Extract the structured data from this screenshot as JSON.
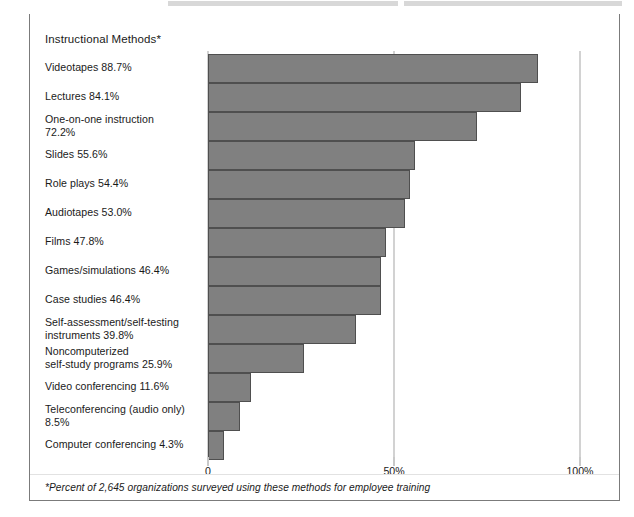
{
  "figure": {
    "title": "Instructional Methods*",
    "footnote": "*Percent of 2,645 organizations surveyed using these methods for employee training",
    "bar_color": "#808080",
    "bar_border_color": "#4f4f4f",
    "gridline_color": "#d2d2d2",
    "frame_color": "#7b7b7b"
  },
  "chart_data": {
    "type": "bar",
    "orientation": "horizontal",
    "title": "Instructional Methods*",
    "xlabel": "",
    "ylabel": "",
    "xlim": [
      0,
      100
    ],
    "grid": true,
    "legend": null,
    "xticks": [
      0,
      50,
      100
    ],
    "xtick_labels": [
      "0",
      "50%",
      "100%"
    ],
    "annotations": [
      "*Percent of 2,645 organizations surveyed using these methods for employee training"
    ],
    "categories": [
      "Videotapes",
      "Lectures",
      "One-on-one instruction",
      "Slides",
      "Role plays",
      "Audiotapes",
      "Films",
      "Games/simulations",
      "Case studies",
      "Self-assessment/self-testing instruments",
      "Noncomputerized self-study programs",
      "Video conferencing",
      "Teleconferencing (audio only)",
      "Computer conferencing"
    ],
    "values": [
      88.7,
      84.1,
      72.2,
      55.6,
      54.4,
      53.0,
      47.8,
      46.4,
      46.4,
      39.8,
      25.9,
      11.6,
      8.5,
      4.3
    ],
    "labels": [
      "Videotapes 88.7%",
      "Lectures 84.1%",
      "One-on-one instruction 72.2%",
      "Slides 55.6%",
      "Role plays 54.4%",
      "Audiotapes 53.0%",
      "Films 47.8%",
      "Games/simulations 46.4%",
      "Case studies 46.4%",
      "Self-assessment/self-testing instruments 39.8%",
      "Noncomputerized self-study programs 25.9%",
      "Video conferencing 11.6%",
      "Teleconferencing (audio only) 8.5%",
      "Computer conferencing 4.3%"
    ],
    "label_lines": [
      [
        "Videotapes 88.7%"
      ],
      [
        "Lectures 84.1%"
      ],
      [
        "One-on-one instruction",
        "72.2%"
      ],
      [
        "Slides 55.6%"
      ],
      [
        "Role plays 54.4%"
      ],
      [
        "Audiotapes 53.0%"
      ],
      [
        "Films 47.8%"
      ],
      [
        "Games/simulations 46.4%"
      ],
      [
        "Case studies 46.4%"
      ],
      [
        "Self-assessment/self-testing",
        "instruments 39.8%"
      ],
      [
        "Noncomputerized",
        "self-study programs 25.9%"
      ],
      [
        "Video conferencing 11.6%"
      ],
      [
        "Teleconferencing (audio only)",
        "8.5%"
      ],
      [
        "Computer conferencing 4.3%"
      ]
    ]
  }
}
